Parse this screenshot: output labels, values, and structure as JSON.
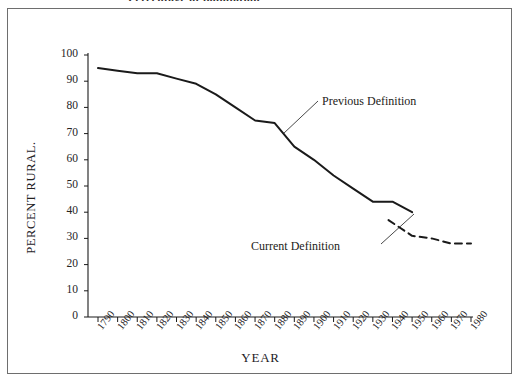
{
  "figure": {
    "top_caption": "Percentage of population…",
    "frame_color": "#6e6e6e",
    "background": "#ffffff",
    "line_color": "#1a1a1a"
  },
  "annotations": {
    "previous": "Previous Definition",
    "current": "Current Definition"
  },
  "chart_data": {
    "type": "line",
    "title": "",
    "xlabel": "YEAR",
    "ylabel": "PERCENT RURAL.",
    "xlim": [
      1790,
      1980
    ],
    "ylim": [
      0,
      100
    ],
    "grid": false,
    "legend": "inline-annotations",
    "xticks": [
      "1790",
      "1800",
      "1810",
      "1820",
      "1830",
      "1840",
      "1850",
      "1860",
      "1870",
      "1880",
      "1890",
      "1900",
      "1910",
      "1920",
      "1930",
      "1940",
      "1950",
      "1960",
      "1970",
      "1980"
    ],
    "yticks": [
      0,
      10,
      20,
      30,
      40,
      50,
      60,
      70,
      80,
      90,
      100
    ],
    "series": [
      {
        "name": "Previous Definition",
        "style": "solid",
        "x": [
          1790,
          1800,
          1810,
          1820,
          1830,
          1840,
          1850,
          1860,
          1870,
          1880,
          1890,
          1900,
          1910,
          1920,
          1930,
          1940,
          1950
        ],
        "values": [
          95,
          94,
          93,
          93,
          91,
          89,
          85,
          80,
          75,
          74,
          65,
          60,
          54,
          49,
          44,
          44,
          40
        ]
      },
      {
        "name": "Current Definition",
        "style": "dashed",
        "x": [
          1938,
          1950,
          1960,
          1970,
          1980
        ],
        "values": [
          37,
          31,
          30,
          28,
          28
        ]
      }
    ]
  }
}
